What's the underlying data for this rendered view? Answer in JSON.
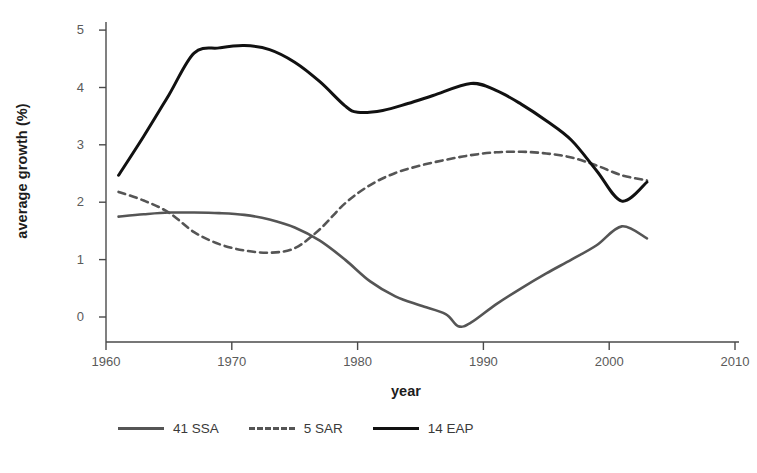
{
  "chart_data": {
    "type": "line",
    "title": "",
    "xlabel": "year",
    "ylabel": "average growth (%)",
    "xlim": [
      1960,
      2010
    ],
    "ylim": [
      -0.5,
      5.4
    ],
    "xticks": [
      1960,
      1970,
      1980,
      1990,
      2000,
      2010
    ],
    "yticks": [
      0,
      1,
      2,
      3,
      4,
      5
    ],
    "xtick_labels": [
      "1960",
      "1970",
      "1980",
      "1990",
      "2000",
      "2010"
    ],
    "ytick_labels": [
      "0",
      "1",
      "2",
      "3",
      "4",
      "5"
    ],
    "grid": false,
    "legend_position": "below-axes-left",
    "series": [
      {
        "name": "41 SSA",
        "label": "41 SSA",
        "color": "#555555",
        "style": "solid",
        "width": 2.6,
        "x": [
          1961,
          1963,
          1965,
          1967,
          1969,
          1971,
          1973,
          1975,
          1977,
          1979,
          1981,
          1983,
          1985,
          1987,
          1988,
          1989,
          1991,
          1993,
          1995,
          1997,
          1999,
          2001,
          2003
        ],
        "y": [
          1.75,
          1.79,
          1.82,
          1.82,
          1.81,
          1.78,
          1.7,
          1.56,
          1.33,
          1.0,
          0.62,
          0.36,
          0.2,
          0.05,
          -0.16,
          -0.1,
          0.22,
          0.5,
          0.76,
          1.0,
          1.25,
          1.58,
          1.37
        ]
      },
      {
        "name": "5 SAR",
        "label": "5 SAR",
        "color": "#555555",
        "style": "dashed",
        "width": 2.6,
        "x": [
          1961,
          1963,
          1965,
          1967,
          1969,
          1971,
          1973,
          1975,
          1977,
          1979,
          1981,
          1983,
          1985,
          1987,
          1989,
          1991,
          1993,
          1995,
          1997,
          1999,
          2001,
          2003
        ],
        "y": [
          2.18,
          2.03,
          1.82,
          1.48,
          1.27,
          1.16,
          1.12,
          1.2,
          1.53,
          1.98,
          2.3,
          2.51,
          2.64,
          2.74,
          2.82,
          2.87,
          2.88,
          2.85,
          2.78,
          2.64,
          2.47,
          2.38
        ]
      },
      {
        "name": "14 EAP",
        "label": "14 EAP",
        "color": "#111111",
        "style": "solid",
        "width": 3.0,
        "x": [
          1961,
          1963,
          1965,
          1967,
          1969,
          1971,
          1973,
          1975,
          1977,
          1979,
          1980,
          1982,
          1984,
          1986,
          1989,
          1991,
          1993,
          1995,
          1997,
          1999,
          2001,
          2003
        ],
        "y": [
          2.47,
          3.15,
          3.87,
          4.6,
          4.69,
          4.73,
          4.66,
          4.44,
          4.1,
          3.68,
          3.57,
          3.6,
          3.72,
          3.86,
          4.07,
          3.95,
          3.71,
          3.42,
          3.08,
          2.55,
          2.02,
          2.35
        ]
      }
    ],
    "notes": {
      "x_axis_start": 1960,
      "x_axis_end": 2010,
      "y_axis_min": 0,
      "y_axis_max": 5,
      "data_range_years": "1961-2003"
    }
  },
  "axes": {
    "ylabel": "average growth (%)",
    "xlabel": "year",
    "ytick_labels": [
      "5",
      "4",
      "3",
      "2",
      "1",
      "0"
    ],
    "xtick_labels": [
      "1960",
      "1970",
      "1980",
      "1990",
      "2000",
      "2010"
    ]
  },
  "legend": {
    "items": [
      {
        "label": "41 SSA",
        "color": "#555555",
        "style": "solid"
      },
      {
        "label": "5 SAR",
        "color": "#555555",
        "style": "dashed"
      },
      {
        "label": "14 EAP",
        "color": "#111111",
        "style": "solid"
      }
    ]
  },
  "colors": {
    "background": "#ffffff",
    "axis": "#4a4a4a",
    "tick_text": "#5a5a5a",
    "label_text": "#1c1c1c",
    "series_gray": "#555555",
    "series_black": "#111111"
  },
  "footnote": {
    "text": ""
  }
}
